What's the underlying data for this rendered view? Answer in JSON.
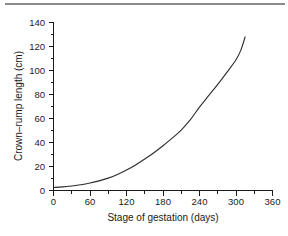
{
  "figure": {
    "name": "crown-rump-length-vs-gestation",
    "top_rule_color": "#8a8a8a",
    "background_color": "#ffffff",
    "curve_color": "#2b2b2b",
    "axis_color": "#1a1a1a"
  },
  "chart_data": {
    "type": "line",
    "title": "",
    "subtitle": "",
    "xlabel": "Stage of gestation (days)",
    "ylabel": "Crown–rump length (cm)",
    "xlim": [
      0,
      360
    ],
    "ylim": [
      0,
      140
    ],
    "x_major_ticks": [
      0,
      60,
      120,
      180,
      240,
      300,
      360
    ],
    "x_major_tick_labels": [
      "0",
      "60",
      "120",
      "180",
      "240",
      "300",
      "360"
    ],
    "x_minor_tick_interval": 30,
    "x_minor_ticks": [
      30,
      90,
      150,
      210,
      270,
      330
    ],
    "y_major_ticks": [
      0,
      20,
      40,
      60,
      80,
      100,
      120,
      140
    ],
    "y_major_tick_labels": [
      "0",
      "20",
      "40",
      "60",
      "80",
      "100",
      "120",
      "140"
    ],
    "y_minor_tick_interval": 10,
    "y_minor_ticks": [
      10,
      30,
      50,
      70,
      90,
      110,
      130
    ],
    "grid": false,
    "legend": false,
    "legend_position": "none",
    "annotations": [],
    "series": [
      {
        "name": "Crown–rump length",
        "x": [
          0,
          15,
          30,
          45,
          60,
          75,
          90,
          105,
          120,
          135,
          150,
          165,
          180,
          195,
          210,
          225,
          240,
          255,
          270,
          285,
          300,
          308,
          315
        ],
        "y": [
          2.5,
          3.0,
          3.8,
          4.8,
          6.2,
          8.0,
          10.3,
          13.3,
          17.0,
          21.3,
          26.2,
          31.5,
          37.3,
          43.6,
          50.4,
          59.0,
          69.5,
          79.0,
          88.5,
          98.5,
          109.0,
          117.0,
          128.0
        ]
      }
    ]
  },
  "axis_labels": {
    "x_title": "Stage of gestation (days)",
    "y_title": "Crown–rump length (cm)"
  }
}
